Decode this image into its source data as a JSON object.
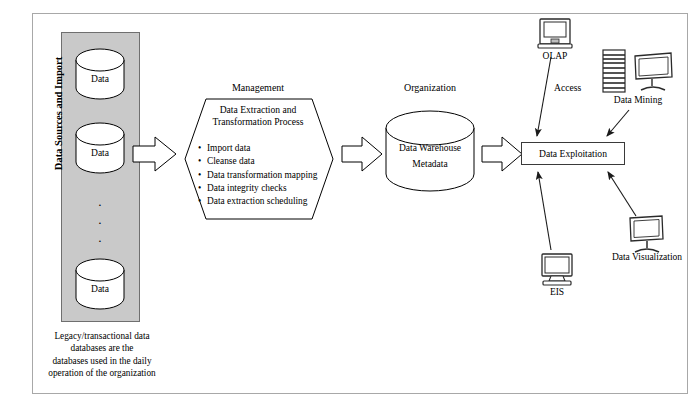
{
  "diagram": {
    "type": "flow-diagram"
  },
  "sources": {
    "axis_label": "Data Sources and Import",
    "cylinder_label": "Data",
    "cylinders": [
      {
        "label": "Data"
      },
      {
        "label": "Data"
      },
      {
        "label": "Data"
      }
    ],
    "ellipsis": "·",
    "caption_lines": [
      "Legacy/transactional data",
      "databases are the",
      "databases used in the daily",
      "operation of the organization"
    ]
  },
  "management": {
    "stage_label": "Management",
    "title_lines": [
      "Data Extraction and",
      "Transformation Process"
    ],
    "bullets": [
      "Import data",
      "Cleanse data",
      "Data transformation mapping",
      "Data integrity checks",
      "Data extraction scheduling"
    ],
    "bullet_glyph": "•"
  },
  "organization": {
    "stage_label": "Organization",
    "warehouse_lines": [
      "Data Warehouse",
      "Metadata"
    ]
  },
  "exploitation": {
    "access_label": "Access",
    "box_label": "Data Exploitation",
    "devices": [
      {
        "name": "olap",
        "label": "OLAP",
        "icon": "crt-monitor-icon"
      },
      {
        "name": "data-mining",
        "label": "Data Mining",
        "icon": "server-and-monitor-icon"
      },
      {
        "name": "data-visualization",
        "label": "Data Visualization",
        "icon": "flat-monitor-icon"
      },
      {
        "name": "eis",
        "label": "EIS",
        "icon": "crt-monitor-icon"
      }
    ]
  },
  "colors": {
    "panel_gray": "#c9c9c9",
    "frame_gray": "#a8a8a8",
    "stroke": "#000000",
    "background": "#ffffff"
  }
}
